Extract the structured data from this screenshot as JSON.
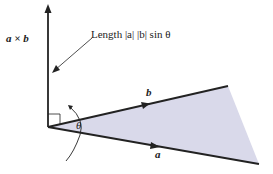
{
  "labels": {
    "cross": "a × b",
    "length": "Length |a| |b| sin θ",
    "b": "b",
    "a": "a",
    "theta": "θ"
  },
  "colors": {
    "fill": "#d9d9ea",
    "line": "#222222"
  }
}
